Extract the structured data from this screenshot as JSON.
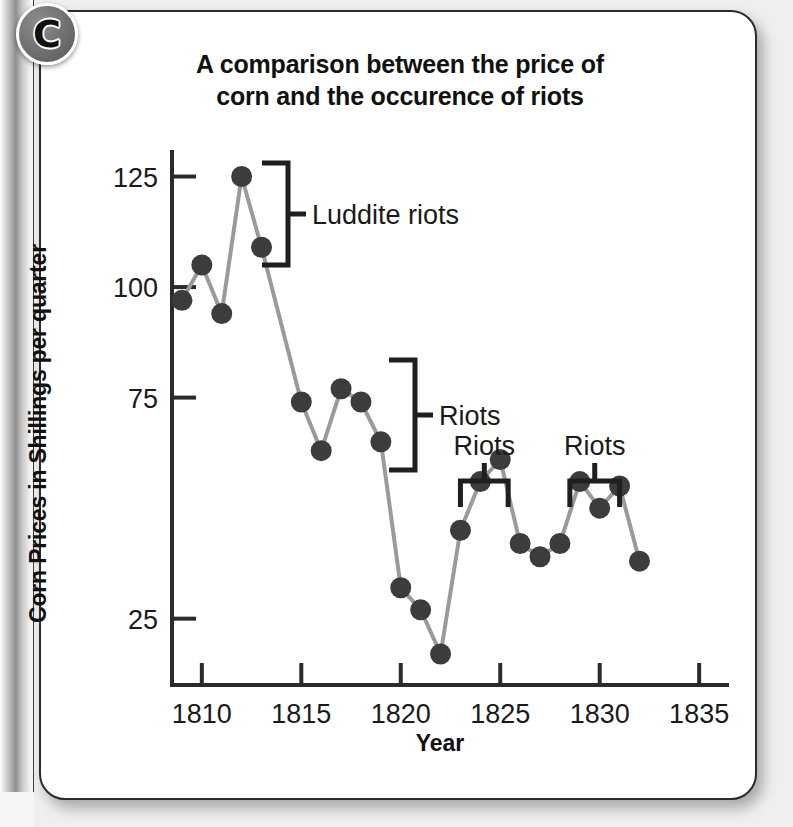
{
  "badge": {
    "letter": "C",
    "name": "section-badge-c"
  },
  "chart_data": {
    "type": "line",
    "title": "A comparison between the price of corn and the occurence of riots",
    "title_line1": "A comparison between the price of",
    "title_line2": "corn and the occurence of riots",
    "xlabel": "Year",
    "ylabel": "Corn Prices in Shillings per quarter",
    "xlim": [
      1808.5,
      1836.5
    ],
    "ylim": [
      10,
      131
    ],
    "grid": false,
    "legend": "none",
    "marker": "filled-circle",
    "line_color": "#9a9a9a",
    "marker_color": "#3c3c3c",
    "axis_color": "#2b2b2b",
    "xticks": [
      1810,
      1815,
      1820,
      1825,
      1830,
      1835
    ],
    "xtick_labels": [
      "1810",
      "1815",
      "1820",
      "1825",
      "1830",
      "1835"
    ],
    "yticks": [
      25,
      75,
      100,
      125
    ],
    "ytick_labels": [
      "25",
      "75",
      "100",
      "125"
    ],
    "x": [
      1809,
      1810,
      1811,
      1812,
      1813,
      1815,
      1816,
      1817,
      1818,
      1819,
      1820,
      1821,
      1822,
      1823,
      1824,
      1825,
      1826,
      1827,
      1828,
      1829,
      1830,
      1831,
      1832
    ],
    "values": [
      97,
      105,
      94,
      125,
      109,
      74,
      63,
      77,
      74,
      65,
      32,
      27,
      17,
      45,
      56,
      61,
      42,
      39,
      42,
      56,
      50,
      55,
      38
    ],
    "annotations": [
      {
        "label": "Luddite riots",
        "bracket": "vertical-right",
        "span_years": [
          1811.5,
          1813.5
        ]
      },
      {
        "label": "Riots",
        "bracket": "vertical-right",
        "span_years": [
          1815.8,
          1819.4
        ]
      },
      {
        "label": "Riots",
        "bracket": "horizontal-down",
        "span_years": [
          1823.0,
          1825.4
        ]
      },
      {
        "label": "Riots",
        "bracket": "horizontal-down",
        "span_years": [
          1828.5,
          1831.0
        ]
      }
    ]
  }
}
